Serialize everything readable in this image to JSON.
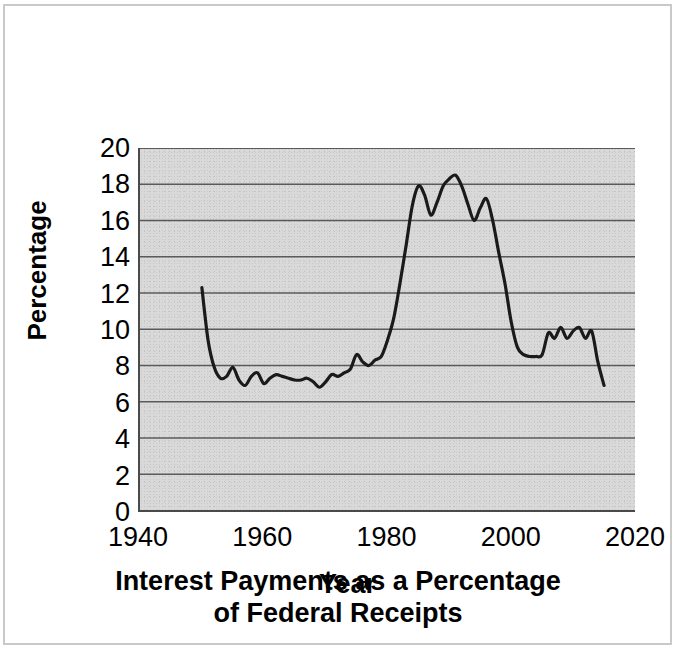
{
  "chart_data": {
    "type": "line",
    "title": "Interest Payments as a Percentage of Federal Receipts",
    "title_line1": "Interest Payments as a Percentage",
    "title_line2": "of Federal Receipts",
    "xlabel": "Year",
    "ylabel": "Percentage",
    "xlim": [
      1940,
      2020
    ],
    "ylim": [
      0,
      20
    ],
    "xticks": [
      1940,
      1960,
      1980,
      2000,
      2020
    ],
    "yticks": [
      0,
      2,
      4,
      6,
      8,
      10,
      12,
      14,
      16,
      18,
      20
    ],
    "grid": "horizontal",
    "legend": "none",
    "plot_background_color": "#d9d9d9",
    "line_color": "#1a1a1a",
    "series": [
      {
        "name": "Interest Payments as a Percentage of Federal Receipts",
        "x": [
          1950,
          1951,
          1952,
          1953,
          1954,
          1955,
          1956,
          1957,
          1958,
          1959,
          1960,
          1961,
          1962,
          1963,
          1964,
          1965,
          1966,
          1967,
          1968,
          1969,
          1970,
          1971,
          1972,
          1973,
          1974,
          1975,
          1976,
          1977,
          1978,
          1979,
          1980,
          1981,
          1982,
          1983,
          1984,
          1985,
          1986,
          1987,
          1988,
          1989,
          1990,
          1991,
          1992,
          1993,
          1994,
          1995,
          1996,
          1997,
          1998,
          1999,
          2000,
          2001,
          2002,
          2003,
          2004,
          2005,
          2006,
          2007,
          2008,
          2009,
          2010,
          2011,
          2012,
          2013,
          2014,
          2015
        ],
        "values": [
          12.3,
          9.4,
          7.9,
          7.3,
          7.4,
          7.9,
          7.2,
          6.9,
          7.4,
          7.6,
          7.0,
          7.3,
          7.5,
          7.4,
          7.3,
          7.2,
          7.2,
          7.3,
          7.1,
          6.8,
          7.1,
          7.5,
          7.4,
          7.6,
          7.8,
          8.6,
          8.2,
          8.0,
          8.3,
          8.5,
          9.4,
          10.6,
          12.5,
          14.6,
          16.8,
          17.9,
          17.4,
          16.3,
          17.0,
          17.9,
          18.3,
          18.5,
          17.9,
          16.9,
          16.0,
          16.7,
          17.2,
          16.0,
          14.2,
          12.5,
          10.4,
          9.0,
          8.6,
          8.5,
          8.5,
          8.6,
          9.8,
          9.5,
          10.1,
          9.5,
          9.9,
          10.1,
          9.5,
          9.9,
          8.2,
          6.9
        ]
      }
    ]
  },
  "axis": {
    "y_ticks": [
      "20",
      "18",
      "16",
      "14",
      "12",
      "10",
      "8",
      "6",
      "4",
      "2",
      "0"
    ],
    "x_ticks": [
      "1940",
      "1960",
      "1980",
      "2000",
      "2020"
    ]
  },
  "labels": {
    "ylabel": "Percentage",
    "title_line1": "Interest Payments as a Percentage",
    "title_line2": "of Federal Receipts",
    "xlabel_overlay": "Year"
  }
}
